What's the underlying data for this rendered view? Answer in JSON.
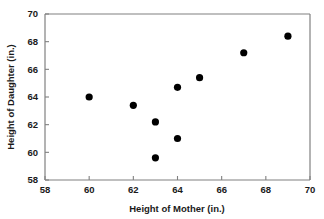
{
  "chart_data": {
    "type": "scatter",
    "title": "",
    "xlabel": "Height of Mother (in.)",
    "ylabel": "Height of Daughter (in.)",
    "xlim": [
      58,
      70
    ],
    "ylim": [
      58,
      70
    ],
    "xticks": [
      58,
      60,
      62,
      64,
      66,
      68,
      70
    ],
    "yticks": [
      58,
      60,
      62,
      64,
      66,
      68,
      70
    ],
    "xtick_labels": [
      "58",
      "60",
      "62",
      "64",
      "66",
      "68",
      "70"
    ],
    "ytick_labels": [
      "58",
      "60",
      "62",
      "64",
      "66",
      "68",
      "70"
    ],
    "grid": false,
    "legend": null,
    "marker": "filled-circle",
    "marker_color": "#000000",
    "axis_color": "#808080",
    "x": [
      60,
      62,
      63,
      63,
      64,
      64,
      65,
      67,
      69
    ],
    "y": [
      64.0,
      63.4,
      62.2,
      59.6,
      61.0,
      64.7,
      65.4,
      67.2,
      68.4
    ],
    "points": [
      {
        "x": 60,
        "y": 64.0
      },
      {
        "x": 62,
        "y": 63.4
      },
      {
        "x": 63,
        "y": 62.2
      },
      {
        "x": 63,
        "y": 59.6
      },
      {
        "x": 64,
        "y": 61.0
      },
      {
        "x": 64,
        "y": 64.7
      },
      {
        "x": 65,
        "y": 65.4
      },
      {
        "x": 67,
        "y": 67.2
      },
      {
        "x": 69,
        "y": 68.4
      }
    ]
  }
}
